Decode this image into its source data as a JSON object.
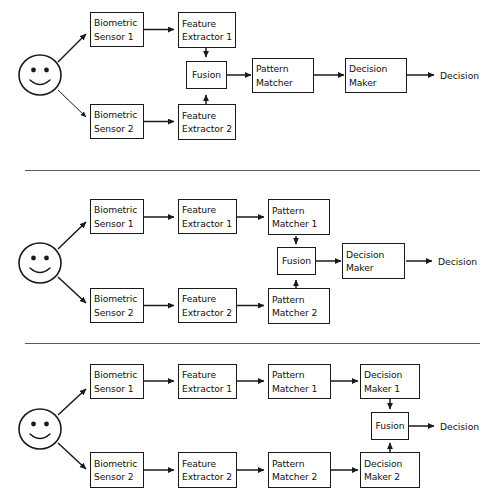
{
  "diagram": {
    "stroke_color": "#1a1a1a",
    "divider_color": "#5a5a5a",
    "background": "#ffffff"
  },
  "labels": {
    "biometric_sensor_1": {
      "line1": "Biometric",
      "line2": "Sensor 1"
    },
    "biometric_sensor_2": {
      "line1": "Biometric",
      "line2": "Sensor 2"
    },
    "feature_extractor_1": {
      "line1": "Feature",
      "line2": "Extractor 1"
    },
    "feature_extractor_2": {
      "line1": "Feature",
      "line2": "Extractor 2"
    },
    "pattern_matcher": {
      "line1": "Pattern",
      "line2": "Matcher"
    },
    "pattern_matcher_1": {
      "line1": "Pattern",
      "line2": "Matcher 1"
    },
    "pattern_matcher_2": {
      "line1": "Pattern",
      "line2": "Matcher 2"
    },
    "decision_maker": {
      "line1": "Decision",
      "line2": "Maker"
    },
    "decision_maker_1": {
      "line1": "Decision",
      "line2": "Maker 1"
    },
    "decision_maker_2": {
      "line1": "Decision",
      "line2": "Maker 2"
    },
    "fusion": "Fusion",
    "decision_output": "Decision",
    "user_icon": "smiley-face"
  },
  "panels": [
    {
      "id": "feature-level-fusion",
      "fusion_stage": "after-feature-extraction",
      "nodes": [
        "Biometric Sensor 1",
        "Feature Extractor 1",
        "Biometric Sensor 2",
        "Feature Extractor 2",
        "Fusion",
        "Pattern Matcher",
        "Decision Maker"
      ],
      "output": "Decision"
    },
    {
      "id": "score-level-fusion",
      "fusion_stage": "after-pattern-matching",
      "nodes": [
        "Biometric Sensor 1",
        "Feature Extractor 1",
        "Pattern Matcher 1",
        "Biometric Sensor 2",
        "Feature Extractor 2",
        "Pattern Matcher 2",
        "Fusion",
        "Decision Maker"
      ],
      "output": "Decision"
    },
    {
      "id": "decision-level-fusion",
      "fusion_stage": "after-decision-making",
      "nodes": [
        "Biometric Sensor 1",
        "Feature Extractor 1",
        "Pattern Matcher 1",
        "Decision Maker 1",
        "Biometric Sensor 2",
        "Feature Extractor 2",
        "Pattern Matcher 2",
        "Decision Maker 2",
        "Fusion"
      ],
      "output": "Decision"
    }
  ]
}
